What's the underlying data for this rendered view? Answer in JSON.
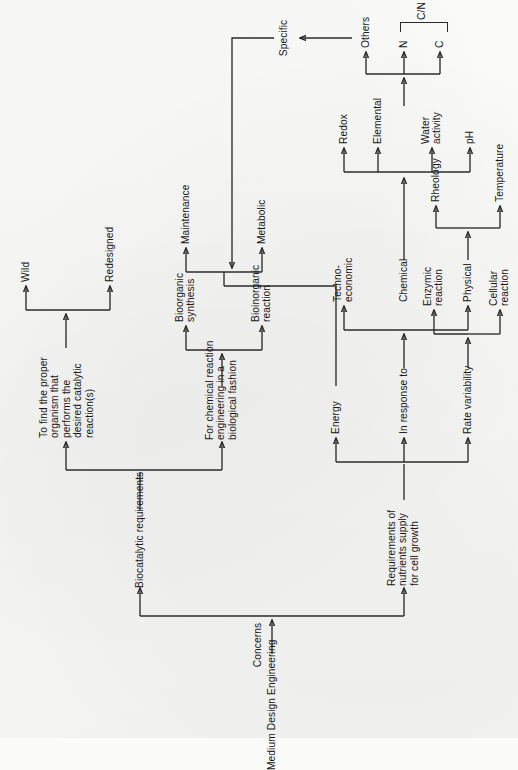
{
  "figure": {
    "type": "flowchart",
    "orientation": "rotated-90-ccw",
    "root": "Medium Design Engineering",
    "root_edge_label": "Concerns"
  },
  "nodes": {
    "root": "Medium Design Engineering",
    "concerns": "Concerns",
    "biocatalytic": "Biocatalytic requirements",
    "nutrients": "Requirements of\nnutrients supply\nfor cell growth",
    "find_organism": "To find the proper\norganism that\nperforms the\ndesired catalytic\nreaction(s)",
    "chem_rxn_eng": "For chemical reaction\nengineering in a\nbiological fashion",
    "wild": "Wild",
    "redesigned": "Redesigned",
    "bioorganic_synthesis": "Bioorganic\nsynthesis",
    "bioinorganic_reaction": "Bioinorganic\nreaction",
    "maintenance": "Maintenance",
    "metabolic": "Metabolic",
    "specific": "Specific",
    "rate_variability": "Rate variability",
    "in_response_to": "In response to",
    "energy": "Energy",
    "cellular_reaction": "Cellular\nreaction",
    "enzymic_reaction": "Enzymic\nreaction",
    "techno_economic": "Techno-\neconomic",
    "chemical": "Chemical",
    "physical": "Physical",
    "temperature": "Temperature",
    "rheology": "Rheology",
    "ph": "pH",
    "water_activity": "Water\nactivity",
    "elemental": "Elemental",
    "redox": "Redox",
    "carbon": "C",
    "nitrogen": "N",
    "cn_ratio": "C/N ratio",
    "others": "Others"
  },
  "edges": [
    {
      "from": "root",
      "to": "concerns"
    },
    {
      "from": "concerns",
      "to": "biocatalytic"
    },
    {
      "from": "concerns",
      "to": "nutrients"
    },
    {
      "from": "biocatalytic",
      "to": "find_organism"
    },
    {
      "from": "biocatalytic",
      "to": "chem_rxn_eng"
    },
    {
      "from": "find_organism",
      "to": "wild"
    },
    {
      "from": "find_organism",
      "to": "redesigned"
    },
    {
      "from": "chem_rxn_eng",
      "to": "bioorganic_synthesis"
    },
    {
      "from": "chem_rxn_eng",
      "to": "bioinorganic_reaction"
    },
    {
      "from": "nutrients",
      "to": "rate_variability"
    },
    {
      "from": "nutrients",
      "to": "in_response_to"
    },
    {
      "from": "nutrients",
      "to": "energy"
    },
    {
      "from": "rate_variability",
      "to": "cellular_reaction"
    },
    {
      "from": "rate_variability",
      "to": "enzymic_reaction"
    },
    {
      "from": "in_response_to",
      "to": "chemical"
    },
    {
      "from": "chemical",
      "to": "techno_economic"
    },
    {
      "from": "chemical",
      "to": "physical"
    },
    {
      "from": "physical",
      "to": "temperature"
    },
    {
      "from": "physical",
      "to": "rheology"
    },
    {
      "from": "chemical",
      "to": "ph"
    },
    {
      "from": "chemical",
      "to": "water_activity"
    },
    {
      "from": "chemical",
      "to": "elemental"
    },
    {
      "from": "chemical",
      "to": "redox"
    },
    {
      "from": "elemental",
      "to": "carbon"
    },
    {
      "from": "elemental",
      "to": "nitrogen"
    },
    {
      "from": "elemental",
      "to": "others"
    },
    {
      "from": "energy",
      "to": "maintenance"
    },
    {
      "from": "energy",
      "to": "metabolic"
    },
    {
      "from": "specific",
      "to": "maintenance"
    },
    {
      "from": "specific",
      "to": "metabolic"
    },
    {
      "from": "others",
      "to": "specific"
    }
  ],
  "annotations": {
    "cn_brace_label": "C/N ratio"
  },
  "colors": {
    "page": "#fbfbfa",
    "ink": "#2b2b2b",
    "text": "#171717"
  }
}
